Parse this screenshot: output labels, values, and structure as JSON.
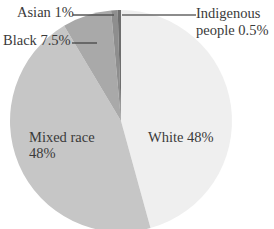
{
  "chart_data": {
    "type": "pie",
    "title": "",
    "slices": [
      {
        "label": "White",
        "value": 48,
        "display": "White 48%",
        "color": "#efefef"
      },
      {
        "label": "Mixed race",
        "value": 48,
        "display": "Mixed race 48%",
        "color": "#c6c6c6"
      },
      {
        "label": "Black",
        "value": 7.5,
        "display": "Black 7.5%",
        "color": "#a9a9a9"
      },
      {
        "label": "Asian",
        "value": 1,
        "display": "Asian 1%",
        "color": "#8e8e8e"
      },
      {
        "label": "Indigenous people",
        "value": 0.5,
        "display": "Indigenous people 0.5%",
        "color": "#6e6e6e"
      }
    ],
    "categories": [
      "White",
      "Mixed race",
      "Black",
      "Asian",
      "Indigenous people"
    ],
    "values": [
      48,
      48,
      7.5,
      1,
      0.5
    ],
    "unit": "%",
    "legend": "none (direct labels with leader lines)"
  },
  "labels": {
    "asian": "Asian 1%",
    "black": "Black 7.5%",
    "indigenous_line1": "Indigenous",
    "indigenous_line2": "people 0.5%",
    "mixed_line1": "Mixed race",
    "mixed_line2": "48%",
    "white": "White 48%"
  }
}
